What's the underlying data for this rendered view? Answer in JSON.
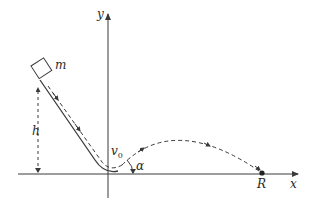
{
  "diagram": {
    "labels": {
      "y_axis": "y",
      "x_axis": "x",
      "mass": "m",
      "height": "h",
      "velocity": "v",
      "velocity_sub": "0",
      "angle": "α",
      "range": "R"
    },
    "colors": {
      "line": "#3a3a3a",
      "text": "#2a2a2a",
      "background": "#ffffff"
    }
  }
}
